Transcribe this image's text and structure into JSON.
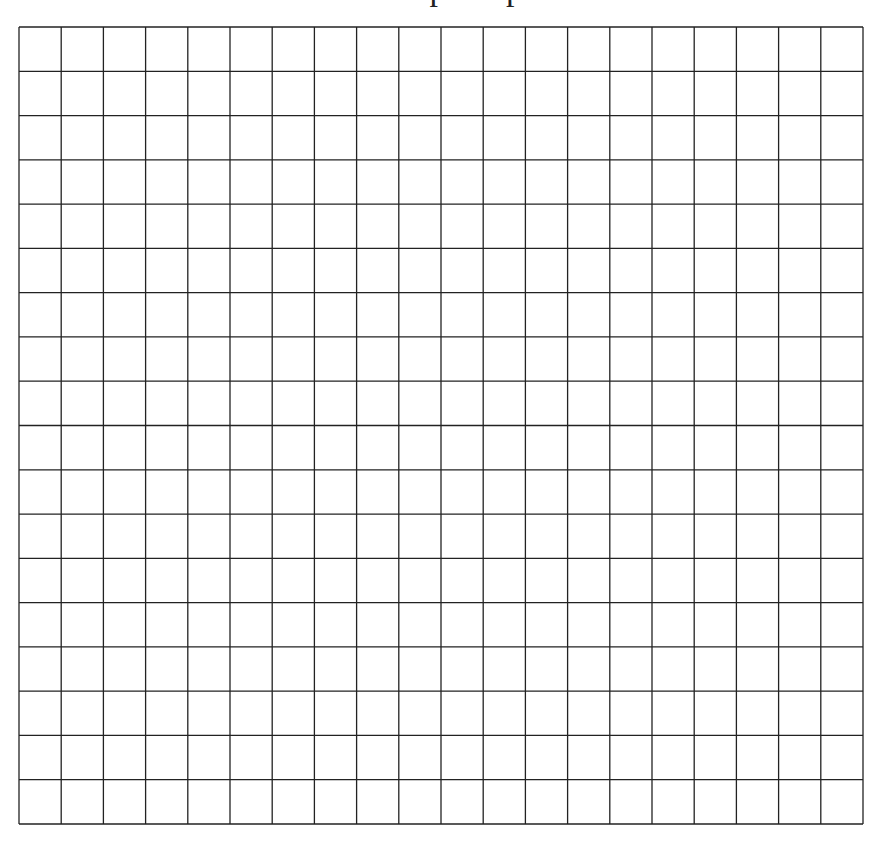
{
  "title": {
    "text": "Graph Paper Grid",
    "visible_fragment": "g"
  },
  "grid": {
    "rows": 18,
    "columns": 20,
    "line_color": "#222222",
    "background": "#ffffff"
  }
}
